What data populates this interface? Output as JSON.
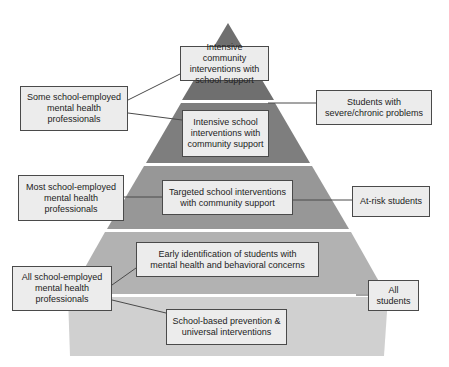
{
  "diagram": {
    "type": "tiered-pyramid",
    "colors": {
      "tier1": "#6f6f6f",
      "tier2": "#7e7e7e",
      "tier3": "#979797",
      "tier4": "#b2b2b2",
      "tier5": "#d0d0d0",
      "box_fill": "#ececec",
      "box_border": "#4a4a4a",
      "connector": "#4a4a4a"
    },
    "tiers": [
      {
        "level": 1,
        "label": "Intensive community\ninterventions with\nschool support"
      },
      {
        "level": 2,
        "label": "Intensive school\ninterventions with\ncommunity support"
      },
      {
        "level": 3,
        "label": "Targeted school interventions\nwith community support"
      },
      {
        "level": 4,
        "label": "Early identification of students with\nmental health and behavioral concerns"
      },
      {
        "level": 5,
        "label": "School-based prevention &\nuniversal interventions"
      }
    ],
    "providers": [
      {
        "label": "Some school-employed\nmental health\nprofessionals"
      },
      {
        "label": "Most school-employed\nmental health\nprofessionals"
      },
      {
        "label": "All school-employed\nmental health\nprofessionals"
      }
    ],
    "populations": [
      {
        "label": "Students with\nsevere/chronic problems"
      },
      {
        "label": "At-risk students"
      },
      {
        "label": "All students"
      }
    ]
  }
}
